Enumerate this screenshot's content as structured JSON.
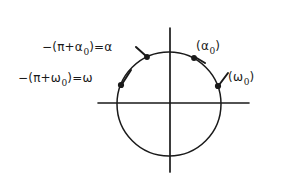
{
  "figure": {
    "background_color": "#ffffff",
    "ink_color": "#1a1a1a",
    "width": 283,
    "height": 180
  },
  "axes": {
    "horizontal": {
      "y": 103,
      "x_start": 98,
      "x_end": 249
    },
    "vertical": {
      "x": 170,
      "y_start": 28,
      "y_end": 172
    },
    "origin": {
      "x": 170,
      "y": 103
    }
  },
  "circle": {
    "center_x": 169,
    "center_y": 104,
    "radius": 52
  },
  "points": [
    {
      "name": "alpha-negative",
      "x": 147,
      "y": 57
    },
    {
      "name": "alpha-zero",
      "x": 194,
      "y": 58
    },
    {
      "name": "omega-negative",
      "x": 121,
      "y": 85
    },
    {
      "name": "omega-zero",
      "x": 218,
      "y": 86
    }
  ],
  "labels": {
    "alpha_negative": {
      "prefix": "−(π+α",
      "subscript": "0",
      "suffix": ")=α"
    },
    "omega_negative": {
      "prefix": "−(π+ω",
      "subscript": "0",
      "suffix": ")=ω"
    },
    "alpha_zero": {
      "prefix": "(α",
      "subscript": "0",
      "suffix": ")"
    },
    "omega_zero": {
      "prefix": "(ω",
      "subscript": "0",
      "suffix": ")"
    }
  },
  "leaders": [
    {
      "name": "leader-alpha-negative",
      "from_x": 136,
      "from_y": 47,
      "to_x": 146,
      "to_y": 56
    },
    {
      "name": "leader-alpha-zero",
      "from_x": 205,
      "from_y": 63,
      "to_x": 195,
      "to_y": 57
    },
    {
      "name": "leader-omega-negative",
      "from_x": 131,
      "from_y": 70,
      "to_x": 122,
      "to_y": 84
    },
    {
      "name": "leader-omega-zero",
      "from_x": 228,
      "from_y": 73,
      "to_x": 219,
      "to_y": 85
    }
  ]
}
